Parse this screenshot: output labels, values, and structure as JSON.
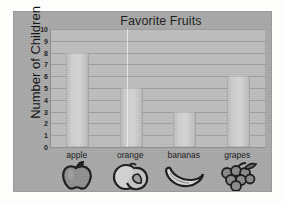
{
  "chart_data": {
    "type": "bar",
    "title": "Favorite Fruits",
    "xlabel": "",
    "ylabel": "Number of Children",
    "categories": [
      "apple",
      "orange",
      "bananas",
      "grapes"
    ],
    "values": [
      8,
      5,
      3,
      6
    ],
    "ylim": [
      0,
      10
    ],
    "ytick_labels": [
      "10",
      "9",
      "8",
      "7",
      "6",
      "5",
      "4",
      "3",
      "2",
      "1",
      "0"
    ],
    "ytick_values": [
      10,
      9,
      8,
      7,
      6,
      5,
      4,
      3,
      2,
      1,
      0
    ],
    "grid": true,
    "legend": null,
    "icons": [
      "apple-icon",
      "orange-icon",
      "banana-icon",
      "grapes-icon"
    ],
    "colors": {
      "card_background": "#a8a8a8",
      "plot_background": "#bdbdbd",
      "bar_fill": "#cdcdcd",
      "gridline": "#9d9d9d",
      "axis": "#8e8e8e",
      "text": "#1d1d1d"
    }
  }
}
